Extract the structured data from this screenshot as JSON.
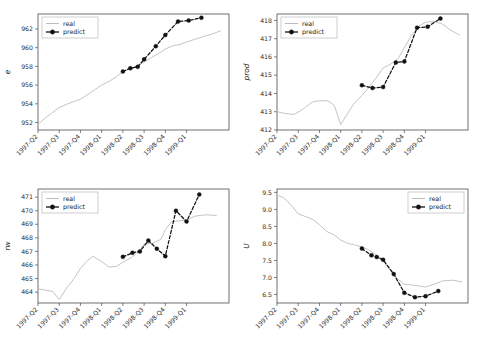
{
  "figure": {
    "title": "",
    "background": "#ffffff",
    "layout": "2x2 grid of time-series line charts",
    "series_colors": {
      "real": "#bdbdbd",
      "predict": "#111111"
    }
  },
  "legend": {
    "entries": [
      {
        "label": "real",
        "style": "solid-thin-gray-line"
      },
      {
        "label": "predict",
        "style": "dashed-black-line-with-markers"
      }
    ]
  },
  "x_categories": [
    "1997-Q2",
    "1997-Q3",
    "1997-Q4",
    "1998-Q1",
    "1998-Q2",
    "1998-Q3",
    "1998-Q4",
    "1999-Q1"
  ],
  "chart_data": [
    {
      "type": "line",
      "title": "",
      "ylabel": "e",
      "xlabel": "",
      "grid": false,
      "legend_position": "upper left",
      "ylim": [
        951.2,
        963.6
      ],
      "yticks": [
        952,
        954,
        956,
        958,
        960,
        962
      ],
      "xlim": [
        0,
        9
      ],
      "xticks": [
        0,
        1,
        2,
        3,
        4,
        5,
        6,
        7
      ],
      "xticklabels": [
        "1997-Q2",
        "1997-Q3",
        "1997-Q4",
        "1998-Q1",
        "1998-Q2",
        "1998-Q3",
        "1998-Q4",
        "1999-Q1"
      ],
      "series": [
        {
          "name": "real",
          "x": [
            0,
            0.35,
            0.7,
            1.0,
            1.35,
            1.7,
            2.0,
            2.35,
            2.7,
            3.0,
            3.35,
            3.7,
            4.0,
            4.35,
            4.7,
            5.0,
            5.35,
            5.7,
            6.0,
            6.35,
            6.7,
            7.0,
            7.4,
            7.8,
            8.2,
            8.6
          ],
          "values": [
            951.8,
            952.5,
            953.1,
            953.6,
            953.95,
            954.25,
            954.5,
            955.0,
            955.55,
            956.0,
            956.4,
            956.9,
            957.45,
            957.75,
            958.1,
            958.45,
            958.95,
            959.4,
            959.85,
            960.2,
            960.35,
            960.6,
            960.9,
            961.2,
            961.45,
            961.8
          ]
        },
        {
          "name": "predict",
          "x": [
            4.0,
            4.35,
            4.7,
            5.0,
            5.55,
            6.0,
            6.6,
            7.1,
            7.7
          ],
          "values": [
            957.45,
            957.8,
            957.95,
            958.75,
            960.15,
            961.35,
            962.8,
            962.9,
            963.2
          ]
        }
      ]
    },
    {
      "type": "line",
      "title": "",
      "ylabel": "prod",
      "xlabel": "",
      "grid": false,
      "legend_position": "upper left",
      "ylim": [
        412.0,
        418.35
      ],
      "yticks": [
        412,
        413,
        414,
        415,
        416,
        417,
        418
      ],
      "xlim": [
        0,
        9
      ],
      "xticks": [
        0,
        1,
        2,
        3,
        4,
        5,
        6,
        7
      ],
      "xticklabels": [
        "1997-Q2",
        "1997-Q3",
        "1997-Q4",
        "1998-Q1",
        "1998-Q2",
        "1998-Q3",
        "1998-Q4",
        "1999-Q1"
      ],
      "series": [
        {
          "name": "real",
          "x": [
            0,
            0.4,
            0.8,
            1.1,
            1.4,
            1.7,
            2.0,
            2.4,
            2.7,
            3.0,
            3.3,
            3.6,
            4.0,
            4.35,
            4.7,
            5.0,
            5.35,
            5.7,
            6.0,
            6.35,
            6.7,
            7.0,
            7.4,
            7.8,
            8.2,
            8.6
          ],
          "values": [
            413.0,
            412.9,
            412.85,
            413.05,
            413.3,
            413.55,
            413.6,
            413.6,
            413.35,
            412.3,
            412.85,
            413.4,
            413.9,
            414.35,
            414.9,
            415.4,
            415.6,
            415.9,
            416.5,
            417.2,
            417.7,
            417.9,
            417.95,
            417.8,
            417.45,
            417.2
          ]
        },
        {
          "name": "predict",
          "x": [
            4.0,
            4.5,
            5.0,
            5.6,
            6.0,
            6.6,
            7.1,
            7.7
          ],
          "values": [
            414.45,
            414.3,
            414.35,
            415.7,
            415.75,
            417.6,
            417.65,
            418.1
          ]
        }
      ]
    },
    {
      "type": "line",
      "title": "",
      "ylabel": "rw",
      "xlabel": "",
      "grid": false,
      "legend_position": "upper left",
      "ylim": [
        463.2,
        471.6
      ],
      "yticks": [
        464,
        465,
        466,
        467,
        468,
        469,
        470,
        471
      ],
      "xlim": [
        0,
        9
      ],
      "xticks": [
        0,
        1,
        2,
        3,
        4,
        5,
        6,
        7
      ],
      "xticklabels": [
        "1997-Q2",
        "1997-Q3",
        "1997-Q4",
        "1998-Q1",
        "1998-Q2",
        "1998-Q3",
        "1998-Q4",
        "1999-Q1"
      ],
      "series": [
        {
          "name": "real",
          "x": [
            0,
            0.35,
            0.7,
            1.0,
            1.35,
            1.7,
            2.0,
            2.35,
            2.6,
            3.0,
            3.35,
            3.7,
            4.0,
            4.4,
            4.8,
            5.0,
            5.4,
            5.8,
            6.0,
            6.3,
            6.6,
            7.0,
            7.4,
            7.9,
            8.4
          ],
          "values": [
            464.25,
            464.15,
            464.05,
            463.45,
            464.3,
            465.0,
            465.75,
            466.35,
            466.65,
            466.25,
            465.85,
            465.9,
            466.2,
            466.55,
            467.1,
            467.55,
            467.6,
            467.9,
            468.6,
            469.2,
            469.25,
            469.3,
            469.6,
            469.7,
            469.65
          ]
        },
        {
          "name": "predict",
          "x": [
            4.0,
            4.45,
            4.8,
            5.2,
            5.6,
            6.0,
            6.5,
            7.0,
            7.6
          ],
          "values": [
            466.6,
            466.9,
            467.0,
            467.8,
            467.2,
            466.65,
            470.0,
            469.2,
            471.2
          ]
        }
      ]
    },
    {
      "type": "line",
      "title": "",
      "ylabel": "U",
      "xlabel": "",
      "grid": false,
      "legend_position": "upper right",
      "ylim": [
        6.25,
        9.6
      ],
      "yticks": [
        6.5,
        7.0,
        7.5,
        8.0,
        8.5,
        9.0,
        9.5
      ],
      "xlim": [
        0,
        9
      ],
      "xticks": [
        0,
        1,
        2,
        3,
        4,
        5,
        6,
        7
      ],
      "xticklabels": [
        "1997-Q2",
        "1997-Q3",
        "1997-Q4",
        "1998-Q1",
        "1998-Q2",
        "1998-Q3",
        "1998-Q4",
        "1999-Q1"
      ],
      "series": [
        {
          "name": "real",
          "x": [
            0,
            0.3,
            0.7,
            1.0,
            1.3,
            1.7,
            2.0,
            2.35,
            2.7,
            3.0,
            3.35,
            3.7,
            4.0,
            4.35,
            4.7,
            5.0,
            5.35,
            5.7,
            6.0,
            6.35,
            6.7,
            7.0,
            7.4,
            7.8,
            8.3,
            8.7
          ],
          "values": [
            9.42,
            9.35,
            9.1,
            8.87,
            8.8,
            8.7,
            8.55,
            8.35,
            8.25,
            8.1,
            8.0,
            7.95,
            7.9,
            7.8,
            7.65,
            7.5,
            7.2,
            6.95,
            6.8,
            6.78,
            6.75,
            6.72,
            6.8,
            6.9,
            6.92,
            6.87
          ]
        },
        {
          "name": "predict",
          "x": [
            4.0,
            4.45,
            4.7,
            5.0,
            5.5,
            6.0,
            6.5,
            7.0,
            7.6
          ],
          "values": [
            7.85,
            7.65,
            7.6,
            7.52,
            7.1,
            6.55,
            6.42,
            6.45,
            6.6
          ]
        }
      ]
    }
  ]
}
